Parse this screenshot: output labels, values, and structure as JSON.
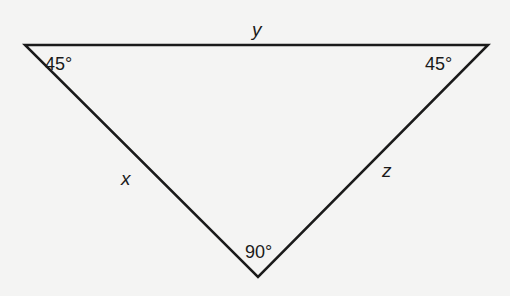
{
  "diagram": {
    "type": "right isosceles triangle",
    "vertices": {
      "top_left": {
        "x": 25,
        "y": 45
      },
      "top_right": {
        "x": 488,
        "y": 45
      },
      "bottom": {
        "x": 258,
        "y": 277
      }
    },
    "angles": {
      "top_left": "45°",
      "top_right": "45°",
      "bottom": "90°"
    },
    "sides": {
      "top": "y",
      "left": "x",
      "right": "z"
    },
    "colors": {
      "background": "#f4f4f3",
      "stroke": "#1a1a1a"
    }
  }
}
